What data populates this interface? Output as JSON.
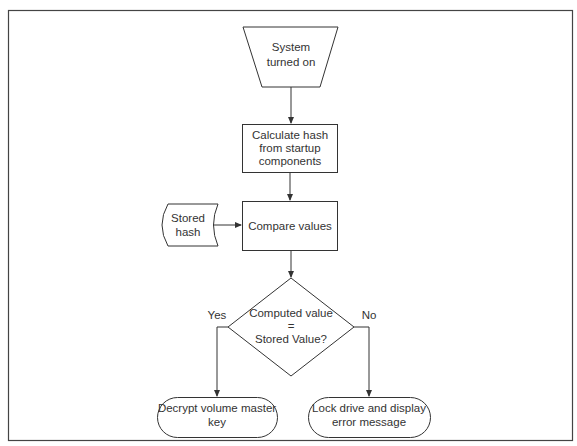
{
  "diagram": {
    "type": "flowchart",
    "colors": {
      "stroke": "#333333",
      "background": "#ffffff",
      "text": "#333333"
    },
    "nodes": {
      "start": {
        "shape": "manual-operation",
        "line1": "System",
        "line2": "turned on"
      },
      "calculate": {
        "shape": "process",
        "line1": "Calculate hash",
        "line2": "from startup",
        "line3": "components"
      },
      "stored": {
        "shape": "stored-data",
        "line1": "Stored",
        "line2": "hash"
      },
      "compare": {
        "shape": "process",
        "line1": "Compare values"
      },
      "decision": {
        "shape": "decision",
        "line1": "Computed value",
        "line2": "=",
        "line3": "Stored Value?"
      },
      "decrypt": {
        "shape": "terminator",
        "line1": "Decrypt volume master",
        "line2": "key"
      },
      "lock": {
        "shape": "terminator",
        "line1": "Lock drive and display",
        "line2": "error message"
      }
    },
    "edges": {
      "yes_label": "Yes",
      "no_label": "No"
    }
  }
}
